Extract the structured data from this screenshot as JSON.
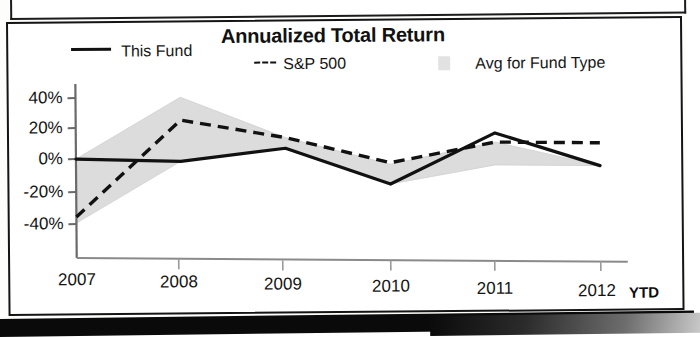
{
  "chart_data": {
    "type": "line",
    "title": "Annualized Total Return",
    "xlabel": "",
    "ylabel": "",
    "categories": [
      "2007",
      "2008",
      "2009",
      "2010",
      "2011",
      "2012"
    ],
    "x_last_suffix": "YTD",
    "ytick_labels": [
      "40%",
      "20%",
      "0%",
      "-20%",
      "-40%"
    ],
    "ytick_values": [
      40,
      20,
      0,
      -20,
      -40
    ],
    "ylim": [
      -50,
      45
    ],
    "grid": false,
    "legend_position": "top",
    "series": [
      {
        "name": "This Fund",
        "style": "solid",
        "color": "#111111",
        "values": [
          0,
          -2,
          6,
          -18,
          15,
          -7
        ]
      },
      {
        "name": "S&P 500",
        "style": "dashed",
        "color": "#111111",
        "values": [
          -38,
          25,
          13,
          -4,
          9,
          8
        ]
      },
      {
        "name": "Avg for Fund Type",
        "style": "band",
        "color": "#d8d8d8",
        "upper": [
          0,
          40,
          13,
          -5,
          9,
          -7
        ],
        "lower": [
          -42,
          -2,
          6,
          -18,
          -6,
          -7
        ]
      }
    ]
  },
  "legend": {
    "fund_label": "This Fund",
    "sp_label": "S&P 500",
    "avg_label": "Avg for Fund Type"
  },
  "axis": {
    "y_40": "40%",
    "y_20": "20%",
    "y_0": "0%",
    "y_neg20": "-20%",
    "y_neg40": "-40%",
    "x_2007": "2007",
    "x_2008": "2008",
    "x_2009": "2009",
    "x_2010": "2010",
    "x_2011": "2011",
    "x_2012": "2012",
    "x_ytd": "YTD"
  },
  "colors": {
    "line": "#111111",
    "band": "#d8d8d8",
    "axis": "#5a5a5a",
    "text": "#141414"
  }
}
